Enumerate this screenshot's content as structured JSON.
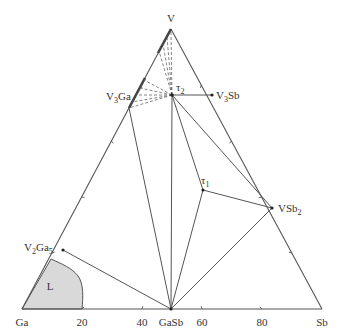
{
  "diagram": {
    "type": "ternary-phase-diagram",
    "vertices": {
      "top": "V",
      "left": "Ga",
      "right": "Sb"
    },
    "bottom_axis_ticks": [
      "20",
      "40",
      "60",
      "80"
    ],
    "phases": [
      {
        "id": "V3Ga",
        "base": "V",
        "sub": "3",
        "rest": "Ga",
        "label": "V3Ga"
      },
      {
        "id": "V3Sb",
        "base": "V",
        "sub": "3",
        "rest": "Sb",
        "label": "V3Sb"
      },
      {
        "id": "V2Ga5",
        "base": "V",
        "sub": "2",
        "rest": "Ga",
        "sub2": "5",
        "label": "V2Ga5"
      },
      {
        "id": "VSb2",
        "base": "VSb",
        "sub": "2",
        "label": "VSb2"
      },
      {
        "id": "GaSb",
        "label": "GaSb"
      },
      {
        "id": "tau1",
        "base": "τ",
        "sub": "1",
        "label": "τ1"
      },
      {
        "id": "tau2",
        "base": "τ",
        "sub": "2",
        "label": "τ2"
      }
    ],
    "liquid_region_label": "L",
    "colors": {
      "line": "#555555",
      "liquid_fill": "#d9d9d9",
      "text": "#333333"
    }
  }
}
